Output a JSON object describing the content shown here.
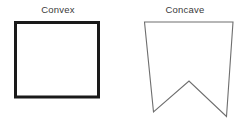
{
  "figure": {
    "background_color": "#ffffff",
    "width": 241,
    "height": 123,
    "shapes": [
      {
        "id": "convex-square",
        "label": "Convex",
        "kind": "polygon",
        "description": "axis-aligned rectangle with thick black outline",
        "stroke_color": "#1a1a1a",
        "stroke_width": 3,
        "fill_color": "#ffffff",
        "vertices": [
          [
            15.5,
            22.5
          ],
          [
            98.5,
            22.5
          ],
          [
            98.5,
            97.0
          ],
          [
            15.5,
            97.0
          ]
        ]
      },
      {
        "id": "concave-banner",
        "label": "Concave",
        "kind": "polygon",
        "description": "pennant / banner shape with a V notch cut into the bottom edge",
        "stroke_color": "#6e6e6e",
        "stroke_width": 1.1,
        "fill_color": "#ffffff",
        "vertices": [
          [
            144.5,
            22.0
          ],
          [
            233.0,
            22.0
          ],
          [
            226.5,
            116.5
          ],
          [
            189.0,
            81.0
          ],
          [
            153.5,
            112.0
          ]
        ]
      }
    ]
  },
  "labels": {
    "convex": "Convex",
    "concave": "Concave",
    "text_color": "#3a3a3a"
  }
}
